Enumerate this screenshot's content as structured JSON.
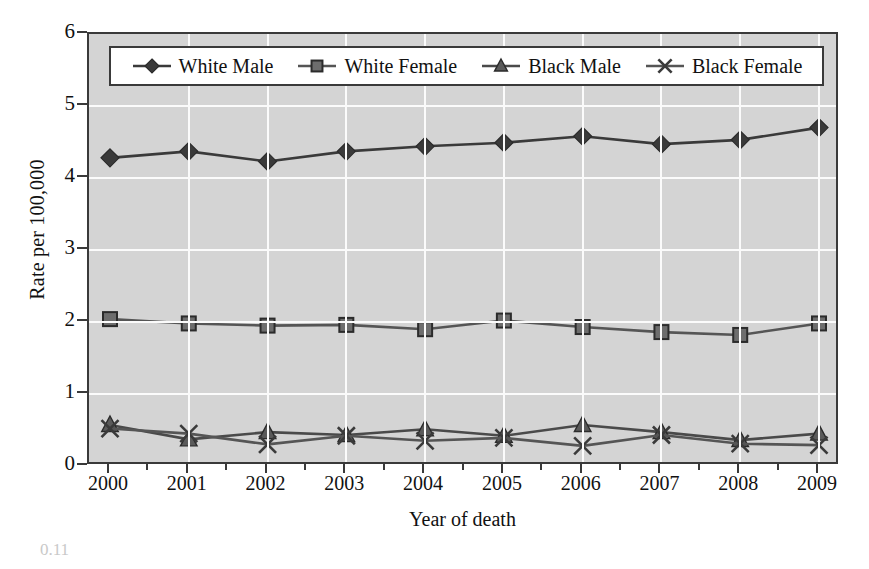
{
  "chart_data": {
    "type": "line",
    "title": "",
    "xlabel": "Year of death",
    "ylabel": "Rate per 100,000",
    "categories": [
      "2000",
      "2001",
      "2002",
      "2003",
      "2004",
      "2005",
      "2006",
      "2007",
      "2008",
      "2009"
    ],
    "x": [
      2000,
      2001,
      2002,
      2003,
      2004,
      2005,
      2006,
      2007,
      2008,
      2009
    ],
    "ylim": [
      0,
      6
    ],
    "xlim": [
      2000,
      2009
    ],
    "yticks": [
      0,
      1,
      2,
      3,
      4,
      5,
      6
    ],
    "ytick_labels": [
      "0",
      "1",
      "2",
      "3",
      "4",
      "5",
      "6"
    ],
    "grid": true,
    "legend_position": "top-inside",
    "plot_background": "#d4d4d4",
    "gridline_color": "#fbfbfb",
    "series": [
      {
        "name": "White Male",
        "marker": "diamond",
        "color": "#3a3a3a",
        "values": [
          4.28,
          4.37,
          4.23,
          4.37,
          4.44,
          4.49,
          4.58,
          4.47,
          4.53,
          4.7
        ]
      },
      {
        "name": "White Female",
        "marker": "square",
        "color": "#555555",
        "values": [
          2.04,
          1.98,
          1.95,
          1.96,
          1.9,
          2.02,
          1.93,
          1.86,
          1.82,
          1.98
        ]
      },
      {
        "name": "Black Male",
        "marker": "triangle",
        "color": "#4a4a4a",
        "values": [
          0.57,
          0.37,
          0.47,
          0.43,
          0.51,
          0.42,
          0.57,
          0.47,
          0.36,
          0.45
        ]
      },
      {
        "name": "Black Female",
        "marker": "x",
        "color": "#555555",
        "values": [
          0.52,
          0.45,
          0.3,
          0.42,
          0.35,
          0.39,
          0.28,
          0.43,
          0.31,
          0.29
        ]
      }
    ]
  },
  "axes": {
    "ylabel": "Rate per 100,000",
    "xlabel": "Year of death"
  },
  "legend": {
    "items": [
      {
        "label": "White Male"
      },
      {
        "label": "White Female"
      },
      {
        "label": "Black Male"
      },
      {
        "label": "Black Female"
      }
    ]
  },
  "artifact": {
    "text": "0.11"
  }
}
